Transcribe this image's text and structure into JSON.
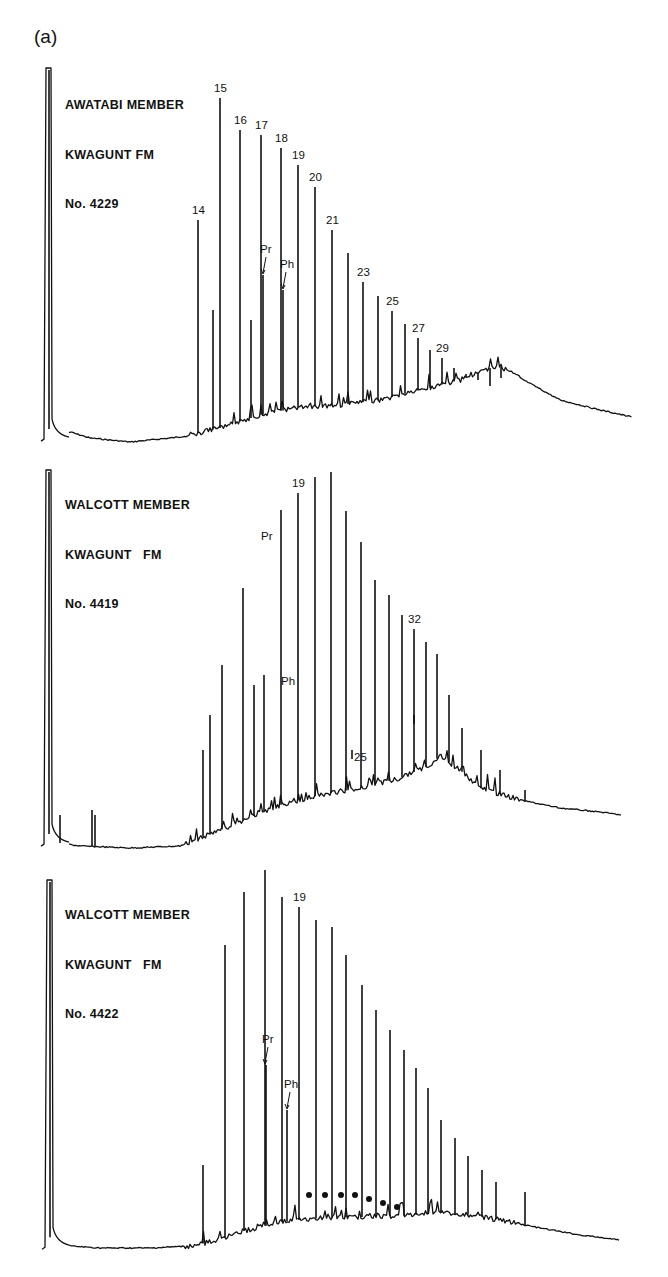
{
  "figure": {
    "label": "(a)"
  },
  "chart_data": [
    {
      "type": "line",
      "title": "AWATABI MEMBER / KWAGUNT FM / No. 4229",
      "title_lines": [
        "AWATABI MEMBER",
        "KWAGUNT FM",
        "No. 4229"
      ],
      "xlabel": "",
      "ylabel": "",
      "grid": false,
      "panel": {
        "top": 60,
        "height": 390,
        "baseline_y": 380
      },
      "solvent_peak": {
        "x": 49,
        "top": 8
      },
      "hump": [
        [
          40,
          380
        ],
        [
          60,
          378
        ],
        [
          70,
          372
        ],
        [
          90,
          378
        ],
        [
          130,
          382
        ],
        [
          180,
          377
        ],
        [
          220,
          368
        ],
        [
          260,
          355
        ],
        [
          300,
          347
        ],
        [
          340,
          345
        ],
        [
          380,
          340
        ],
        [
          420,
          330
        ],
        [
          460,
          320
        ],
        [
          490,
          308
        ],
        [
          500,
          306
        ],
        [
          520,
          318
        ],
        [
          560,
          340
        ],
        [
          600,
          350
        ],
        [
          632,
          357
        ]
      ],
      "peaks": [
        {
          "label": "14",
          "x": 198,
          "top": 160
        },
        {
          "x": 213,
          "top": 250,
          "unlabeled": true
        },
        {
          "label": "15",
          "x": 220,
          "top": 38
        },
        {
          "label": "16",
          "x": 240,
          "top": 70
        },
        {
          "x": 251,
          "top": 260,
          "unlabeled": true
        },
        {
          "label": "17",
          "x": 261,
          "top": 75
        },
        {
          "label": "Pr",
          "x": 263,
          "top": 215,
          "arrow": true
        },
        {
          "label": "18",
          "x": 281,
          "top": 88
        },
        {
          "label": "Ph",
          "x": 283,
          "top": 230,
          "arrow": true
        },
        {
          "label": "19",
          "x": 298,
          "top": 105
        },
        {
          "label": "20",
          "x": 315,
          "top": 127
        },
        {
          "label": "21",
          "x": 332,
          "top": 170
        },
        {
          "x": 348,
          "top": 193,
          "unlabeled": true
        },
        {
          "label": "23",
          "x": 363,
          "top": 222
        },
        {
          "x": 378,
          "top": 236,
          "unlabeled": true
        },
        {
          "label": "25",
          "x": 392,
          "top": 251
        },
        {
          "x": 405,
          "top": 264,
          "unlabeled": true
        },
        {
          "label": "27",
          "x": 418,
          "top": 278
        },
        {
          "x": 430,
          "top": 290,
          "unlabeled": true
        },
        {
          "label": "29",
          "x": 442,
          "top": 298
        },
        {
          "x": 454,
          "top": 308
        },
        {
          "x": 466,
          "top": 314
        },
        {
          "x": 478,
          "top": 320
        },
        {
          "x": 490,
          "top": 326
        },
        {
          "x": 501,
          "top": 318
        }
      ]
    },
    {
      "type": "line",
      "title": "WALCOTT MEMBER / KWAGUNT FM / No. 4419",
      "title_lines": [
        "WALCOTT MEMBER",
        "KWAGUNT   FM",
        "No. 4419"
      ],
      "xlabel": "",
      "ylabel": "",
      "grid": false,
      "panel": {
        "top": 460,
        "height": 400,
        "baseline_y": 385
      },
      "solvent_peak": {
        "x": 49,
        "top": 10
      },
      "hump": [
        [
          40,
          385
        ],
        [
          60,
          383
        ],
        [
          80,
          386
        ],
        [
          130,
          388
        ],
        [
          180,
          386
        ],
        [
          200,
          378
        ],
        [
          240,
          362
        ],
        [
          280,
          345
        ],
        [
          320,
          335
        ],
        [
          360,
          328
        ],
        [
          400,
          318
        ],
        [
          430,
          305
        ],
        [
          440,
          296
        ],
        [
          460,
          310
        ],
        [
          480,
          328
        ],
        [
          520,
          340
        ],
        [
          560,
          348
        ],
        [
          600,
          352
        ],
        [
          622,
          355
        ]
      ],
      "peaks": [
        {
          "x": 60,
          "top": 355
        },
        {
          "x": 92,
          "top": 350
        },
        {
          "x": 95,
          "top": 355
        },
        {
          "x": 203,
          "top": 290
        },
        {
          "x": 210,
          "top": 255
        },
        {
          "x": 222,
          "top": 205
        },
        {
          "x": 243,
          "top": 128
        },
        {
          "x": 254,
          "top": 225
        },
        {
          "x": 263,
          "top": 80,
          "label": "Pr",
          "label_only": true
        },
        {
          "x": 264,
          "top": 215
        },
        {
          "x": 281,
          "top": 50
        },
        {
          "x": 283,
          "top": 225,
          "label": "Ph",
          "label_only": true
        },
        {
          "label": "19",
          "x": 298,
          "top": 33
        },
        {
          "x": 315,
          "top": 17
        },
        {
          "x": 331,
          "top": 12
        },
        {
          "x": 346,
          "top": 51
        },
        {
          "x": 361,
          "top": 82
        },
        {
          "label": "25",
          "x": 352,
          "top": 290,
          "tick": true
        },
        {
          "x": 375,
          "top": 120
        },
        {
          "x": 389,
          "top": 135
        },
        {
          "x": 402,
          "top": 155
        },
        {
          "label": "32",
          "x": 414,
          "top": 169
        },
        {
          "x": 414,
          "top": 255,
          "tick": true
        },
        {
          "x": 426,
          "top": 182
        },
        {
          "x": 437,
          "top": 194
        },
        {
          "x": 449,
          "top": 235
        },
        {
          "x": 462,
          "top": 268
        },
        {
          "x": 481,
          "top": 290
        },
        {
          "x": 500,
          "top": 310
        },
        {
          "x": 525,
          "top": 330
        }
      ]
    },
    {
      "type": "line",
      "title": "WALCOTT MEMBER / KWAGUNT FM / No. 4422",
      "title_lines": [
        "WALCOTT MEMBER",
        "KWAGUNT   FM",
        "No. 4422"
      ],
      "xlabel": "",
      "ylabel": "",
      "grid": false,
      "panel": {
        "top": 870,
        "height": 400,
        "baseline_y": 378
      },
      "solvent_peak": {
        "x": 50,
        "top": 10
      },
      "hump": [
        [
          40,
          378
        ],
        [
          70,
          376
        ],
        [
          100,
          378
        ],
        [
          150,
          378
        ],
        [
          190,
          376
        ],
        [
          210,
          372
        ],
        [
          240,
          362
        ],
        [
          280,
          352
        ],
        [
          320,
          348
        ],
        [
          360,
          347
        ],
        [
          400,
          346
        ],
        [
          440,
          343
        ],
        [
          470,
          345
        ],
        [
          500,
          350
        ],
        [
          540,
          358
        ],
        [
          580,
          365
        ],
        [
          620,
          370
        ]
      ],
      "annotations": {
        "dots": {
          "count": 7,
          "y": 325,
          "xs": [
            309,
            325,
            341,
            355,
            369,
            383,
            397
          ]
        }
      },
      "peaks": [
        {
          "x": 203,
          "top": 295
        },
        {
          "x": 225,
          "top": 75
        },
        {
          "x": 244,
          "top": 22
        },
        {
          "label": "Pr",
          "x": 265,
          "top": 0,
          "inner_top": 195,
          "arrow": true
        },
        {
          "x": 282,
          "top": 27
        },
        {
          "label": "Ph",
          "x": 287,
          "top": 240,
          "arrow": true
        },
        {
          "label": "19",
          "x": 299,
          "top": 37
        },
        {
          "x": 316,
          "top": 50
        },
        {
          "x": 332,
          "top": 57
        },
        {
          "x": 346,
          "top": 85
        },
        {
          "x": 362,
          "top": 115
        },
        {
          "x": 376,
          "top": 140
        },
        {
          "x": 390,
          "top": 160
        },
        {
          "x": 404,
          "top": 180
        },
        {
          "x": 416,
          "top": 198
        },
        {
          "x": 428,
          "top": 218
        },
        {
          "x": 441,
          "top": 250
        },
        {
          "x": 455,
          "top": 268
        },
        {
          "x": 468,
          "top": 286
        },
        {
          "x": 482,
          "top": 300
        },
        {
          "x": 496,
          "top": 312
        },
        {
          "x": 525,
          "top": 322
        }
      ]
    }
  ]
}
